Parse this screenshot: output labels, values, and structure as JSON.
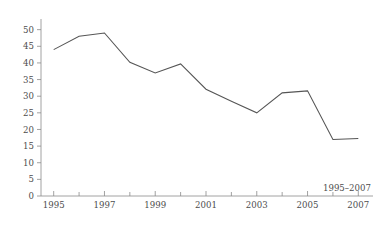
{
  "chart_data": {
    "type": "line",
    "title": "",
    "subtitle": "",
    "xlabel": "",
    "ylabel": "",
    "annotation": "1995–2007",
    "grid": false,
    "legend": "none",
    "xlim": [
      1994.5,
      2007.5
    ],
    "ylim": [
      0,
      52
    ],
    "x": [
      1995,
      1996,
      1997,
      1998,
      1999,
      2000,
      2001,
      2002,
      2003,
      2004,
      2005,
      2006,
      2007
    ],
    "xtick_labels_major": [
      "1995",
      "1997",
      "1999",
      "2001",
      "2003",
      "2005",
      "2007"
    ],
    "xticks_major": [
      1995,
      1997,
      1999,
      2001,
      2003,
      2005,
      2007
    ],
    "xticks_minor": [
      1996,
      1998,
      2000,
      2002,
      2004,
      2006
    ],
    "yticks": [
      0,
      5,
      10,
      15,
      20,
      25,
      30,
      35,
      40,
      45,
      50
    ],
    "ytick_labels": [
      "0",
      "5",
      "10",
      "15",
      "20",
      "25",
      "30",
      "35",
      "40",
      "45",
      "50"
    ],
    "series": [
      {
        "name": "series-1",
        "color": "#555555",
        "values": [
          44.0,
          48.0,
          49.0,
          40.2,
          37.0,
          39.7,
          32.1,
          28.5,
          25.0,
          31.0,
          31.6,
          17.0,
          17.3
        ]
      }
    ]
  },
  "colors": {
    "line": "#555555",
    "axis": "#8a8a8a",
    "text": "#4d4d4d",
    "background": "#ffffff"
  }
}
